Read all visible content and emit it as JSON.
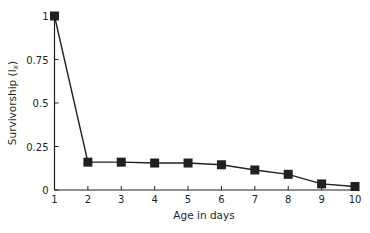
{
  "chart_data": {
    "type": "line",
    "title": "",
    "xlabel": "Age in days",
    "ylabel": "Survivorship (l",
    "ylabel_sub": "x",
    "ylabel_close": ")",
    "x": [
      1,
      2,
      3,
      4,
      5,
      6,
      7,
      8,
      9,
      10
    ],
    "series": [
      {
        "name": "Survivorship",
        "values": [
          1.0,
          0.16,
          0.16,
          0.155,
          0.155,
          0.145,
          0.115,
          0.09,
          0.035,
          0.02
        ],
        "marker": "square",
        "color": "#231f20"
      }
    ],
    "xlim": [
      1,
      10
    ],
    "ylim": [
      0,
      1
    ],
    "xticks": [
      "1",
      "2",
      "3",
      "4",
      "5",
      "6",
      "7",
      "8",
      "9",
      "10"
    ],
    "yticks": [
      {
        "value": 0,
        "label": "0"
      },
      {
        "value": 0.25,
        "label": "0.25"
      },
      {
        "value": 0.5,
        "label": "0.5"
      },
      {
        "value": 0.75,
        "label": "0.75"
      },
      {
        "value": 1,
        "label": "1"
      }
    ],
    "grid": false,
    "legend": null
  },
  "colors": {
    "ink": "#231f20",
    "background": "#ffffff"
  }
}
